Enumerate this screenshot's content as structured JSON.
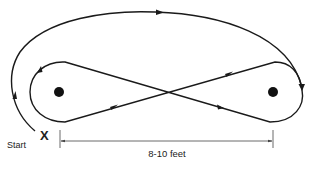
{
  "diagram": {
    "type": "figure-eight walking path",
    "start_label": "Start",
    "start_marker": "X",
    "dimension_label": "8-10 feet",
    "colors": {
      "stroke": "#1a1a1a",
      "dimension": "#444444",
      "background": "#ffffff"
    },
    "elements": {
      "cones": [
        {
          "name": "left-cone",
          "cx": 59,
          "cy": 92
        },
        {
          "name": "right-cone",
          "cx": 273,
          "cy": 92
        }
      ]
    }
  }
}
